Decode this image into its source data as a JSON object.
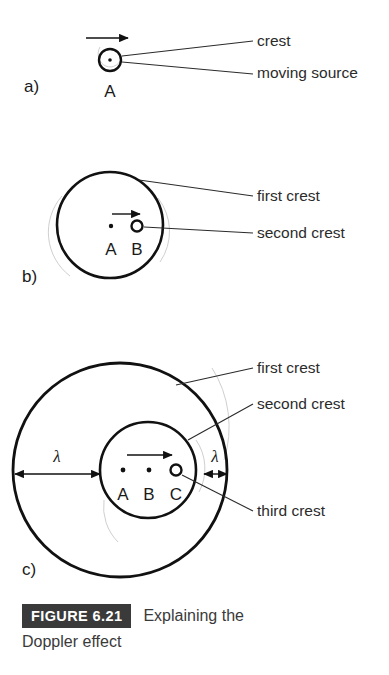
{
  "figure": {
    "badge_label": "FIGURE 6.21",
    "caption_lead": "Explaining the",
    "caption_rest": "Doppler effect"
  },
  "panels": [
    {
      "id": "a",
      "letter": "a)",
      "letter_x": 24,
      "letter_y": 92,
      "source_dot": {
        "x": 110,
        "y": 60,
        "label": "A",
        "label_x": 110,
        "label_y": 97
      },
      "motion_arrow": {
        "x1": 86,
        "y1": 38,
        "x2": 128,
        "y2": 38
      },
      "circles": [
        {
          "name": "crest",
          "cx": 110,
          "cy": 60,
          "r": 11,
          "stroke_width": 2.4
        }
      ],
      "callouts": [
        {
          "text": "crest",
          "text_x": 257,
          "text_y": 46,
          "leader": {
            "x1": 253,
            "y1": 41,
            "x2": 122,
            "y2": 56
          }
        },
        {
          "text": "moving source",
          "text_x": 257,
          "text_y": 78,
          "leader": {
            "x1": 253,
            "y1": 74,
            "x2": 122,
            "y2": 62
          }
        }
      ]
    },
    {
      "id": "b",
      "letter": "b)",
      "letter_x": 22,
      "letter_y": 282,
      "motion_arrow": {
        "x1": 112,
        "y1": 214,
        "x2": 140,
        "y2": 214
      },
      "points": [
        {
          "label": "A",
          "x": 111,
          "y": 226,
          "label_x": 111,
          "label_y": 255,
          "dot_r": 2.2
        },
        {
          "label": "B",
          "x": 137,
          "y": 226,
          "label_x": 137,
          "label_y": 255,
          "dot_r": 0
        }
      ],
      "circles": [
        {
          "name": "first-crest",
          "cx": 110,
          "cy": 225,
          "r": 53,
          "stroke_width": 2.6
        },
        {
          "name": "second-crest",
          "cx": 137,
          "cy": 226,
          "r": 5.5,
          "stroke_width": 2.4
        }
      ],
      "callouts": [
        {
          "text": "first crest",
          "text_x": 257,
          "text_y": 201,
          "leader": {
            "x1": 253,
            "y1": 196,
            "x2": 139,
            "y2": 180
          }
        },
        {
          "text": "second crest",
          "text_x": 257,
          "text_y": 238,
          "leader": {
            "x1": 253,
            "y1": 233,
            "x2": 144,
            "y2": 227
          }
        }
      ]
    },
    {
      "id": "c",
      "letter": "c)",
      "letter_x": 22,
      "letter_y": 575,
      "motion_arrow": {
        "x1": 127,
        "y1": 455,
        "x2": 172,
        "y2": 455
      },
      "points": [
        {
          "label": "A",
          "x": 123,
          "y": 470,
          "label_x": 123,
          "label_y": 500,
          "dot_r": 2.4
        },
        {
          "label": "B",
          "x": 149,
          "y": 470,
          "label_x": 149,
          "label_y": 500,
          "dot_r": 2.4
        },
        {
          "label": "C",
          "x": 176,
          "y": 470,
          "label_x": 176,
          "label_y": 500,
          "dot_r": 0
        }
      ],
      "circles": [
        {
          "name": "first-crest",
          "cx": 120,
          "cy": 470,
          "r": 107,
          "stroke_width": 2.8
        },
        {
          "name": "second-crest",
          "cx": 148,
          "cy": 470,
          "r": 48,
          "stroke_width": 2.6
        },
        {
          "name": "third-crest",
          "cx": 176,
          "cy": 470,
          "r": 5.5,
          "stroke_width": 2.4
        }
      ],
      "dimensions": [
        {
          "label": "λ",
          "label_x": 57,
          "label_y": 462,
          "line": {
            "x1": 15,
            "y1": 474,
            "x2": 100,
            "y2": 474
          },
          "name": "wavelength-behind"
        },
        {
          "label": "λ",
          "label_x": 215,
          "label_y": 462,
          "line": {
            "x1": 204,
            "y1": 474,
            "x2": 227,
            "y2": 474
          },
          "name": "wavelength-ahead"
        }
      ],
      "callouts": [
        {
          "text": "first crest",
          "text_x": 257,
          "text_y": 373,
          "leader": {
            "x1": 253,
            "y1": 368,
            "x2": 176,
            "y2": 385
          }
        },
        {
          "text": "second crest",
          "text_x": 257,
          "text_y": 409,
          "leader": {
            "x1": 253,
            "y1": 404,
            "x2": 188,
            "y2": 440
          }
        },
        {
          "text": "third crest",
          "text_x": 257,
          "text_y": 516,
          "leader": {
            "x1": 253,
            "y1": 511,
            "x2": 182,
            "y2": 475
          }
        }
      ]
    }
  ],
  "colors": {
    "ink": "#111111",
    "text": "#2b2b2b",
    "badge_bg": "#3a3a3a",
    "badge_fg": "#ffffff",
    "paper": "#ffffff"
  }
}
